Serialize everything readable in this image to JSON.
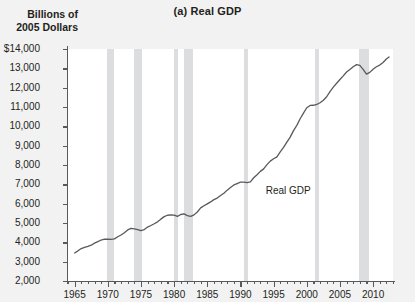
{
  "chart_data": {
    "type": "line",
    "title": "(a) Real GDP",
    "ylabel": "Billions of\n2005 Dollars",
    "xlabel": "",
    "grid": false,
    "legend_position": "inline-annotation",
    "series_annotation": "Real GDP",
    "xlim": [
      1964.0,
      1965.0
    ],
    "ylim": [
      2000,
      14000
    ],
    "y_ticks": [
      2000,
      3000,
      4000,
      5000,
      6000,
      7000,
      8000,
      9000,
      10000,
      11000,
      12000,
      13000,
      14000
    ],
    "y_tick_labels": [
      "2,000",
      "3,000",
      "4,000",
      "5,000",
      "6,000",
      "7,000",
      "8,000",
      "9,000",
      "10,000",
      "11,000",
      "12,000",
      "13,000",
      "$14,000"
    ],
    "x_ticks_major": [
      1965,
      1970,
      1975,
      1980,
      1985,
      1990,
      1995,
      2000,
      2005,
      2010
    ],
    "x_tick_labels": [
      "1965",
      "1970",
      "1975",
      "1980",
      "1985",
      "1990",
      "1995",
      "2000",
      "2005",
      "2010"
    ],
    "x_minor_step": 1,
    "x_range": [
      1964,
      1965
    ],
    "x_axis_start": 1964,
    "x_axis_end": 2013,
    "recession_bands": [
      {
        "start": 1969.9,
        "end": 1970.9,
        "label": "1969-70 recession"
      },
      {
        "start": 1973.9,
        "end": 1975.2,
        "label": "1973-75 recession"
      },
      {
        "start": 1980.0,
        "end": 1980.6,
        "label": "1980 recession"
      },
      {
        "start": 1981.5,
        "end": 1982.9,
        "label": "1981-82 recession"
      },
      {
        "start": 1990.5,
        "end": 1991.2,
        "label": "1990-91 recession"
      },
      {
        "start": 2001.2,
        "end": 2001.9,
        "label": "2001 recession"
      },
      {
        "start": 2007.9,
        "end": 2009.4,
        "label": "2007-09 recession"
      }
    ],
    "x": [
      1965.0,
      1965.5,
      1966.0,
      1966.5,
      1967.0,
      1967.5,
      1968.0,
      1968.5,
      1969.0,
      1969.5,
      1970.0,
      1970.5,
      1971.0,
      1971.5,
      1972.0,
      1972.5,
      1973.0,
      1973.5,
      1974.0,
      1974.5,
      1975.0,
      1975.5,
      1976.0,
      1976.5,
      1977.0,
      1977.5,
      1978.0,
      1978.5,
      1979.0,
      1979.5,
      1980.0,
      1980.5,
      1981.0,
      1981.5,
      1982.0,
      1982.5,
      1983.0,
      1983.5,
      1984.0,
      1984.5,
      1985.0,
      1985.5,
      1986.0,
      1986.5,
      1987.0,
      1987.5,
      1988.0,
      1988.5,
      1989.0,
      1989.5,
      1990.0,
      1990.5,
      1991.0,
      1991.5,
      1992.0,
      1992.5,
      1993.0,
      1993.5,
      1994.0,
      1994.5,
      1995.0,
      1995.5,
      1996.0,
      1996.5,
      1997.0,
      1997.5,
      1998.0,
      1998.5,
      1999.0,
      1999.5,
      2000.0,
      2000.5,
      2001.0,
      2001.5,
      2002.0,
      2002.5,
      2003.0,
      2003.5,
      2004.0,
      2004.5,
      2005.0,
      2005.5,
      2006.0,
      2006.5,
      2007.0,
      2007.5,
      2008.0,
      2008.5,
      2009.0,
      2009.5,
      2010.0,
      2010.5,
      2011.0,
      2011.5,
      2012.0,
      2012.4
    ],
    "y": [
      3450,
      3560,
      3680,
      3740,
      3790,
      3850,
      3960,
      4040,
      4120,
      4160,
      4170,
      4150,
      4180,
      4290,
      4380,
      4500,
      4640,
      4720,
      4700,
      4660,
      4600,
      4660,
      4790,
      4870,
      4960,
      5060,
      5200,
      5330,
      5400,
      5420,
      5410,
      5340,
      5440,
      5470,
      5380,
      5340,
      5420,
      5570,
      5780,
      5890,
      5990,
      6090,
      6210,
      6290,
      6420,
      6540,
      6700,
      6840,
      6970,
      7040,
      7110,
      7110,
      7090,
      7130,
      7340,
      7500,
      7670,
      7800,
      8020,
      8200,
      8320,
      8420,
      8680,
      8910,
      9180,
      9440,
      9780,
      10050,
      10390,
      10680,
      10960,
      11080,
      11090,
      11130,
      11220,
      11350,
      11530,
      11800,
      12030,
      12230,
      12420,
      12610,
      12810,
      12940,
      13080,
      13190,
      13150,
      12950,
      12700,
      12790,
      12950,
      13080,
      13170,
      13300,
      13480,
      13590
    ],
    "units": "Billions of 2005 dollars",
    "start_value": 3450,
    "end_value": 13590,
    "peak_pre_recession": {
      "year": 2007.5,
      "value": 13190
    },
    "trough": {
      "year": 2009.0,
      "value": 12700
    }
  },
  "colors": {
    "background": "#f2f2f2",
    "plot_background": "#ffffff",
    "band": "#dcdddf",
    "line": "#58595b",
    "axis": "#58595b",
    "text": "#231f20"
  }
}
